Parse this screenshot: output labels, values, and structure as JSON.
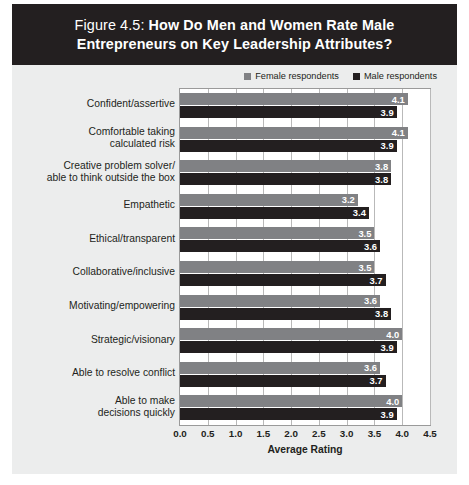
{
  "figure": {
    "title_prefix": "Figure 4.5: ",
    "title_main": "How Do Men and Women Rate Male Entrepreneurs on Key Leadership Attributes?",
    "banner_color": "#231f20",
    "background_color": "#eceded"
  },
  "legend": {
    "position": "top-right",
    "entries": [
      {
        "label": "Female respondents",
        "color": "#808184",
        "icon": "square-swatch-icon"
      },
      {
        "label": "Male respondents",
        "color": "#231f20",
        "icon": "square-swatch-icon"
      }
    ]
  },
  "chart_data": {
    "type": "bar",
    "orientation": "horizontal",
    "title": "Figure 4.5: How Do Men and Women Rate Male Entrepreneurs on Key Leadership Attributes?",
    "xlabel": "Average Rating",
    "ylabel": "",
    "xlim": [
      0.0,
      4.5
    ],
    "xticks": [
      "0.0",
      "0.5",
      "1.0",
      "1.5",
      "2.0",
      "2.5",
      "3.0",
      "3.5",
      "4.0",
      "4.5"
    ],
    "xtick_values": [
      0.0,
      0.5,
      1.0,
      1.5,
      2.0,
      2.5,
      3.0,
      3.5,
      4.0,
      4.5
    ],
    "grid": true,
    "grid_axis": "x",
    "legend_position": "top-right",
    "categories": [
      "Confident/assertive",
      "Comfortable taking calculated risk",
      "Creative problem solver/ able to think outside the box",
      "Empathetic",
      "Ethical/transparent",
      "Collaborative/inclusive",
      "Motivating/empowering",
      "Strategic/visionary",
      "Able to resolve conflict",
      "Able to make decisions quickly"
    ],
    "category_lines": [
      [
        "Confident/assertive"
      ],
      [
        "Comfortable taking",
        "calculated risk"
      ],
      [
        "Creative problem solver/",
        "able to think outside the box"
      ],
      [
        "Empathetic"
      ],
      [
        "Ethical/transparent"
      ],
      [
        "Collaborative/inclusive"
      ],
      [
        "Motivating/empowering"
      ],
      [
        "Strategic/visionary"
      ],
      [
        "Able to resolve conflict"
      ],
      [
        "Able to make",
        "decisions quickly"
      ]
    ],
    "series": [
      {
        "name": "Female respondents",
        "color": "#808184",
        "values": [
          4.1,
          4.1,
          3.8,
          3.2,
          3.5,
          3.5,
          3.6,
          4.0,
          3.6,
          4.0
        ],
        "labels": [
          "4.1",
          "4.1",
          "3.8",
          "3.2",
          "3.5",
          "3.5",
          "3.6",
          "4.0",
          "3.6",
          "4.0"
        ]
      },
      {
        "name": "Male respondents",
        "color": "#231f20",
        "values": [
          3.9,
          3.9,
          3.8,
          3.4,
          3.6,
          3.7,
          3.8,
          3.9,
          3.7,
          3.9
        ],
        "labels": [
          "3.9",
          "3.9",
          "3.8",
          "3.4",
          "3.6",
          "3.7",
          "3.8",
          "3.9",
          "3.7",
          "3.9"
        ]
      }
    ]
  }
}
